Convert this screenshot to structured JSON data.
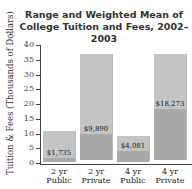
{
  "chart_data": {
    "type": "bar",
    "title_lines": [
      "Range and Weighted Mean of",
      "College Tuition and Fees, 2002–2003"
    ],
    "xlabel": "",
    "ylabel": "Tuition & Fees (Thousands of Dollars)",
    "ylim": [
      0,
      40
    ],
    "yticks": [
      0,
      5,
      10,
      15,
      20,
      25,
      30,
      35,
      40
    ],
    "grid": false,
    "categories": [
      "2 yr Public",
      "2 yr Private",
      "4 yr Public",
      "4 yr Private"
    ],
    "category_lines": [
      [
        "2 yr",
        "Public"
      ],
      [
        "2 yr",
        "Private"
      ],
      [
        "4 yr",
        "Public"
      ],
      [
        "4 yr",
        "Private"
      ]
    ],
    "series": [
      {
        "name": "Range low (thousands)",
        "values": [
          0.5,
          1,
          0.5,
          1
        ]
      },
      {
        "name": "Range high (thousands)",
        "values": [
          11,
          37,
          9,
          37
        ]
      },
      {
        "name": "Weighted mean (thousands)",
        "values": [
          1.735,
          9.89,
          4.081,
          18.273
        ]
      }
    ],
    "mean_labels": [
      "$1,735",
      "$9,890",
      "$4,081",
      "$18,273"
    ],
    "colors": {
      "range": "#c4c4c4",
      "below_mean": "#a9a9a9",
      "axis": "#444444"
    }
  }
}
